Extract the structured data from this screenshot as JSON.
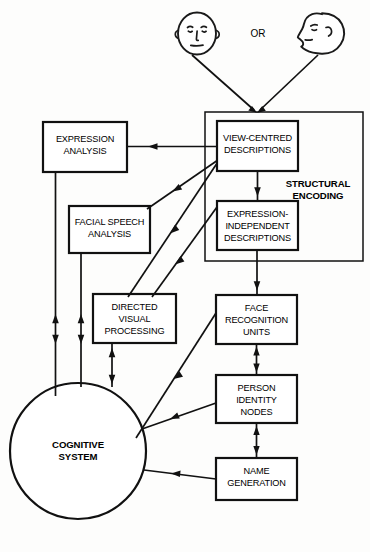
{
  "diagram": {
    "stimuli": {
      "or_label": "OR",
      "face_front_name": "frontal-face-illustration",
      "face_profile_name": "profile-face-illustration"
    },
    "group": {
      "label_line1": "STRUCTURAL",
      "label_line2": "ENCODING"
    },
    "boxes": [
      {
        "id": "expression-analysis",
        "lines": [
          "EXPRESSION",
          "ANALYSIS"
        ]
      },
      {
        "id": "facial-speech-analysis",
        "lines": [
          "FACIAL SPEECH",
          "ANALYSIS"
        ]
      },
      {
        "id": "directed-visual-processing",
        "lines": [
          "DIRECTED",
          "VISUAL",
          "PROCESSING"
        ]
      },
      {
        "id": "view-centred-descriptions",
        "lines": [
          "VIEW-CENTRED",
          "DESCRIPTIONS"
        ]
      },
      {
        "id": "expression-independent-descriptions",
        "lines": [
          "EXPRESSION-",
          "INDEPENDENT",
          "DESCRIPTIONS"
        ]
      },
      {
        "id": "face-recognition-units",
        "lines": [
          "FACE",
          "RECOGNITION",
          "UNITS"
        ]
      },
      {
        "id": "person-identity-nodes",
        "lines": [
          "PERSON",
          "IDENTITY",
          "NODES"
        ]
      },
      {
        "id": "name-generation",
        "lines": [
          "NAME",
          "GENERATION"
        ]
      }
    ],
    "circle": {
      "id": "cognitive-system",
      "lines": [
        "COGNITIVE",
        "SYSTEM"
      ]
    },
    "colors": {
      "background": "#fdfdfc",
      "stroke": "#111111",
      "box_fill": "#ffffff",
      "text": "#000000"
    }
  }
}
